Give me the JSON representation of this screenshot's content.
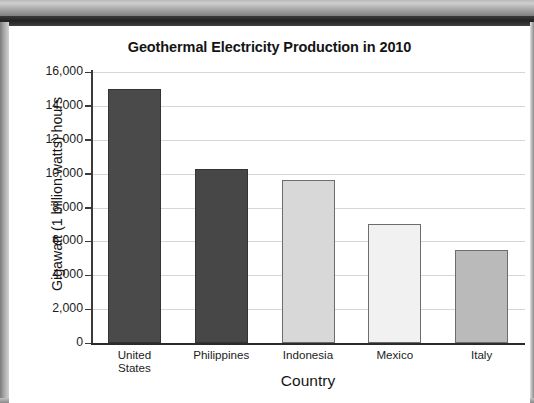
{
  "chart_data": {
    "type": "bar",
    "title": "Geothermal Electricity Production in 2010",
    "xlabel": "Country",
    "ylabel": "Gigawatt (1 billion watts) hours",
    "categories": [
      "United States",
      "Philippines",
      "Indonesia",
      "Mexico",
      "Italy"
    ],
    "category_lines": [
      [
        "United",
        "States"
      ],
      [
        "Philippines"
      ],
      [
        "Indonesia"
      ],
      [
        "Mexico"
      ],
      [
        "Italy"
      ]
    ],
    "values": [
      15000,
      10300,
      9600,
      7000,
      5500
    ],
    "bar_colors": [
      "#4a4a4a",
      "#474747",
      "#d8d8d8",
      "#f1f1f1",
      "#bababa"
    ],
    "ylim": [
      0,
      16000
    ],
    "ytick_values": [
      16000,
      14000,
      12000,
      10000,
      8000,
      6000,
      4000,
      2000,
      0
    ],
    "ytick_labels": [
      "16,000",
      "14,000",
      "12,000",
      "10,000",
      "8,000",
      "6,000",
      "4,000",
      "2,000",
      "0"
    ],
    "grid": true,
    "grid_axis": "y",
    "legend": false
  }
}
